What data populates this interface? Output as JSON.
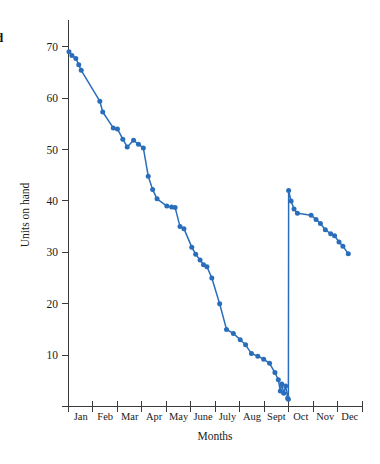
{
  "caption_fragment": "d",
  "chart_data": {
    "type": "line",
    "title": "",
    "xlabel": "Months",
    "ylabel": "Units on hand",
    "grid": false,
    "legend": "none",
    "series_color": "#2a6ebb",
    "xlim": [
      0,
      12
    ],
    "ylim": [
      0,
      74
    ],
    "yticks": [
      10,
      20,
      30,
      40,
      50,
      60,
      70
    ],
    "ytick_labels": [
      "10",
      "20",
      "30",
      "40",
      "50",
      "60",
      "70"
    ],
    "categories": [
      "Jan",
      "Feb",
      "Mar",
      "Apr",
      "May",
      "June",
      "July",
      "Aug",
      "Sept",
      "Oct",
      "Nov",
      "Dec"
    ],
    "annotation": "Sawtooth inventory depletion with a restock jump from 2 to 42 units at the start of October",
    "series": [
      {
        "name": "Units on hand",
        "points": [
          [
            0.02,
            69.0
          ],
          [
            0.14,
            68.3
          ],
          [
            0.3,
            67.7
          ],
          [
            0.42,
            66.5
          ],
          [
            0.52,
            65.4
          ],
          [
            1.28,
            59.4
          ],
          [
            1.4,
            57.3
          ],
          [
            1.83,
            54.2
          ],
          [
            2.0,
            54.0
          ],
          [
            2.22,
            52.0
          ],
          [
            2.4,
            50.5
          ],
          [
            2.66,
            51.8
          ],
          [
            2.86,
            51.0
          ],
          [
            3.06,
            50.3
          ],
          [
            3.26,
            44.8
          ],
          [
            3.44,
            42.2
          ],
          [
            3.62,
            40.4
          ],
          [
            4.02,
            39.0
          ],
          [
            4.22,
            38.8
          ],
          [
            4.36,
            38.7
          ],
          [
            4.56,
            35.0
          ],
          [
            4.72,
            34.6
          ],
          [
            5.04,
            31.0
          ],
          [
            5.2,
            29.6
          ],
          [
            5.38,
            28.5
          ],
          [
            5.52,
            27.6
          ],
          [
            5.66,
            27.2
          ],
          [
            5.86,
            25.0
          ],
          [
            6.18,
            20.0
          ],
          [
            6.46,
            15.0
          ],
          [
            6.74,
            14.2
          ],
          [
            7.02,
            13.0
          ],
          [
            7.24,
            12.0
          ],
          [
            7.48,
            10.3
          ],
          [
            7.74,
            9.8
          ],
          [
            7.98,
            9.2
          ],
          [
            8.22,
            8.4
          ],
          [
            8.44,
            6.6
          ],
          [
            8.58,
            5.2
          ],
          [
            8.66,
            3.0
          ],
          [
            8.72,
            4.4
          ],
          [
            8.8,
            2.6
          ],
          [
            8.88,
            4.0
          ],
          [
            8.96,
            1.6
          ],
          [
            8.99,
            1.4
          ],
          [
            9.0,
            42.0
          ],
          [
            9.1,
            40.0
          ],
          [
            9.22,
            38.4
          ],
          [
            9.36,
            37.6
          ],
          [
            9.92,
            37.2
          ],
          [
            10.12,
            36.4
          ],
          [
            10.3,
            35.6
          ],
          [
            10.5,
            34.4
          ],
          [
            10.72,
            33.6
          ],
          [
            10.88,
            33.2
          ],
          [
            11.06,
            32.0
          ],
          [
            11.22,
            31.2
          ],
          [
            11.44,
            29.7
          ]
        ]
      }
    ]
  }
}
